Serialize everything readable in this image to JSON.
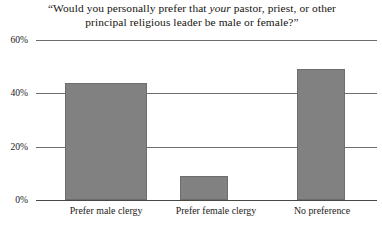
{
  "chart_data": {
    "type": "bar",
    "title": "“Would you personally prefer that your pastor, priest, or other principal religious leader be male or female?”",
    "title_line1_pre": "“Would you personally prefer that ",
    "title_line1_italic": "your",
    "title_line1_post": " pastor, priest, or other",
    "title_line2": "principal religious leader be male or female?”",
    "categories": [
      "Prefer male clergy",
      "Prefer female clergy",
      "No preference"
    ],
    "values": [
      44,
      9,
      49
    ],
    "value_labels": [
      "44%",
      "9%",
      "49%"
    ],
    "xlabel": "",
    "ylabel": "",
    "ylim": [
      0,
      60
    ],
    "yticks": [
      0,
      20,
      40,
      60
    ],
    "ytick_labels": [
      "0%",
      "20%",
      "40%",
      "60%"
    ],
    "grid": true,
    "legend": false,
    "legend_position": "none",
    "bar_color": "#818181",
    "gridline_color": "#6f6d69",
    "background_color": "#ffffff",
    "text_color": "#1a1a1a"
  }
}
